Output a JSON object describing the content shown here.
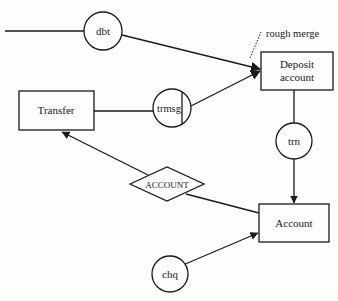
{
  "diagram": {
    "type": "data-flow",
    "nodes": {
      "deposit_account": {
        "shape": "rectangle",
        "line1": "Deposit",
        "line2": "account"
      },
      "transfer": {
        "shape": "rectangle",
        "label": "Transfer"
      },
      "account": {
        "shape": "rectangle",
        "label": "Account"
      },
      "dbt": {
        "shape": "circle",
        "label": "dbt"
      },
      "trmsg": {
        "shape": "circle",
        "label": "trmsg"
      },
      "trn": {
        "shape": "circle",
        "label": "trn"
      },
      "chq": {
        "shape": "circle",
        "label": "chq"
      },
      "account_store": {
        "shape": "diamond",
        "label": "ACCOUNT"
      }
    },
    "annotations": {
      "rough_merge": "rough merge"
    },
    "edges": [
      {
        "from": "external",
        "to": "dbt",
        "arrow": false
      },
      {
        "from": "dbt",
        "to": "deposit_account",
        "arrow": true
      },
      {
        "from": "transfer",
        "to": "trmsg",
        "arrow": false
      },
      {
        "from": "trmsg",
        "to": "deposit_account",
        "arrow": true
      },
      {
        "from": "deposit_account",
        "to": "trn",
        "arrow": false
      },
      {
        "from": "trn",
        "to": "account",
        "arrow": true
      },
      {
        "from": "account",
        "to": "account_store",
        "arrow": false
      },
      {
        "from": "account_store",
        "to": "transfer",
        "arrow": true
      },
      {
        "from": "chq",
        "to": "account",
        "arrow": true
      }
    ],
    "colors": {
      "stroke": "#1a1a1a",
      "background": "#fdfdfb"
    }
  }
}
